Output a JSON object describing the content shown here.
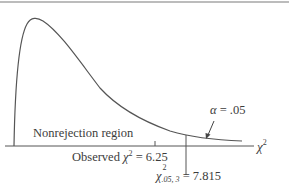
{
  "diagram": {
    "distribution": "chi-square",
    "degrees_of_freedom": 3,
    "axis_label": {
      "symbol": "χ",
      "superscript": "2"
    },
    "regions": {
      "nonrejection_label": "Nonrejection region",
      "rejection_alpha_label": {
        "symbol": "α",
        "text": " = .05"
      }
    },
    "observed": {
      "prefix": "Observed ",
      "symbol": "χ",
      "superscript": "2",
      "suffix": " = 6.25",
      "value": 6.25
    },
    "critical": {
      "symbol": "χ",
      "superscript": "2",
      "subscript": ".05, 3",
      "suffix": " = 7.815",
      "value": 7.815,
      "alpha": 0.05
    },
    "colors": {
      "curve": "#555555",
      "axis": "#555555",
      "text": "#3c3c3c",
      "top_rule": "#777777"
    }
  }
}
